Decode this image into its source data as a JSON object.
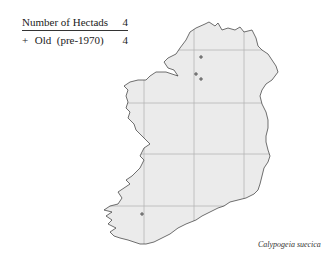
{
  "legend": {
    "header_label": "Number of Hectads",
    "header_value": "4",
    "rows": [
      {
        "symbol": "+",
        "label": "Old  (pre-1970)",
        "value": "4"
      }
    ]
  },
  "map": {
    "region": "Ireland",
    "land_color": "#ebebeb",
    "coast_color": "#333333",
    "grid_color": "#b5b5b5",
    "grid_x": [
      144,
      194,
      244
    ],
    "grid_y": [
      50,
      103,
      154,
      206
    ],
    "records": [
      {
        "symbol": "+",
        "category": "Old (pre-1970)",
        "x": 201,
        "y": 57
      },
      {
        "symbol": "+",
        "category": "Old (pre-1970)",
        "x": 196,
        "y": 74
      },
      {
        "symbol": "+",
        "category": "Old (pre-1970)",
        "x": 201,
        "y": 79
      },
      {
        "symbol": "+",
        "category": "Old (pre-1970)",
        "x": 142,
        "y": 214
      }
    ]
  },
  "species_name": "Calypogeia suecica"
}
